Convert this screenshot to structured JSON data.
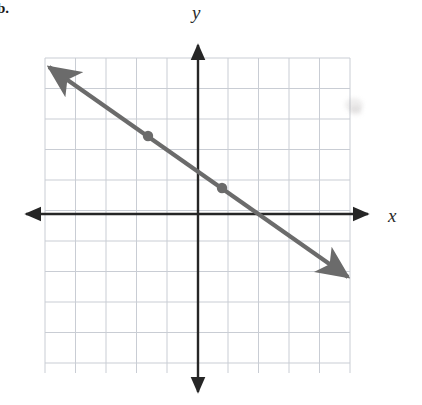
{
  "figure": {
    "item_label": "b.",
    "width": 422,
    "height": 405,
    "background_color": "#ffffff"
  },
  "axes": {
    "x_label": "x",
    "y_label": "y",
    "axis_color": "#262626",
    "origin_px": {
      "x": 198,
      "y": 214
    },
    "unit_px": 30.5,
    "x_axis": {
      "start_px": {
        "x": 26,
        "y": 214
      },
      "end_px": {
        "x": 368,
        "y": 214
      },
      "arrows": "both"
    },
    "y_axis": {
      "start_px": {
        "x": 198,
        "y": 45
      },
      "end_px": {
        "x": 198,
        "y": 392
      },
      "arrows": "both"
    }
  },
  "grid": {
    "color": "#c9cdd4",
    "left_px": 45,
    "top_px": 58,
    "right_px": 350,
    "bottom_px": 373,
    "columns": 10,
    "rows": 10,
    "cell_px": 30.5,
    "show": true
  },
  "chart_data": {
    "type": "line",
    "title": "",
    "xlabel": "x",
    "ylabel": "y",
    "grid": true,
    "legend": "none",
    "xlim": [
      -5,
      5
    ],
    "ylim": [
      -5,
      5
    ],
    "x_ticks": [
      -5,
      -4,
      -3,
      -2,
      -1,
      0,
      1,
      2,
      3,
      4,
      5
    ],
    "y_ticks": [
      -5,
      -4,
      -3,
      -2,
      -1,
      0,
      1,
      2,
      3,
      4,
      5
    ],
    "tick_labels_shown": false,
    "series": [
      {
        "name": "plotted-line",
        "type": "line",
        "color": "#6b6b6b",
        "slope": -0.7,
        "intercept": 1.4,
        "arrows": "both",
        "endpoints_px": [
          {
            "x": 49,
            "y": 67
          },
          {
            "x": 348,
            "y": 277
          }
        ],
        "marked_points": [
          {
            "x": -1.6,
            "y": 2.6,
            "px": {
              "x": 148,
              "y": 136
            }
          },
          {
            "x": 0.8,
            "y": 0.9,
            "px": {
              "x": 222,
              "y": 188
            }
          }
        ]
      }
    ]
  },
  "artifacts": {
    "smudges": [
      {
        "x": 345,
        "y": 98,
        "w": 18,
        "h": 14
      },
      {
        "x": 350,
        "y": 106,
        "w": 12,
        "h": 9
      }
    ]
  }
}
